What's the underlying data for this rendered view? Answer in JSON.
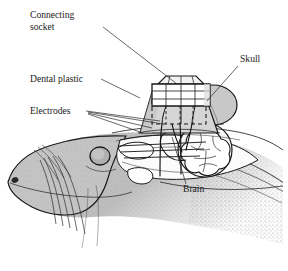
{
  "figure": {
    "background_color": "#ffffff",
    "ink_color": "#1a1a1a",
    "palette": {
      "skin_light": "#cfcfcf",
      "skin_mid": "#b4b4b4",
      "skin_dark": "#9a9a9a",
      "plastic_fill": "#d8d8d8",
      "socket_fill": "#ffffff",
      "skull_fill": "#c9c9c9",
      "brain_fill": "#ffffff",
      "cavity_fill": "#fdfdfd",
      "stipple": "#6f6f6f"
    }
  },
  "labels": [
    {
      "id": "connecting-socket",
      "lines": [
        "Connecting",
        "socket"
      ],
      "text_x": 30,
      "text_y": 18,
      "line_height": 11.5,
      "anchor": "start",
      "leader": "M 103 27 L 177 84"
    },
    {
      "id": "dental-plastic",
      "lines": [
        "Dental plastic"
      ],
      "text_x": 30,
      "text_y": 82,
      "line_height": 11.5,
      "anchor": "start",
      "leader": "M 101 79 L 140 98"
    },
    {
      "id": "electrodes",
      "lines": [
        "Electrodes"
      ],
      "text_x": 30,
      "text_y": 114,
      "line_height": 11.5,
      "anchor": "start",
      "leader": "M 86 111 L 160 121"
    },
    {
      "id": "skull",
      "lines": [
        "Skull"
      ],
      "text_x": 240,
      "text_y": 62,
      "line_height": 11.5,
      "anchor": "start",
      "leader": "M 238 66 L 207 101"
    },
    {
      "id": "brain",
      "lines": [
        "Brain"
      ],
      "text_x": 183,
      "text_y": 192,
      "line_height": 11.5,
      "anchor": "start",
      "leader": "M 186 184 L 172 137"
    }
  ],
  "electrode_leaders": [
    "M 88 112 L 163 124",
    "M 88 113 L 152 128",
    "M 88 114 L 143 133"
  ],
  "parts": {
    "connecting_socket": {
      "name": "connecting-socket",
      "description": "rectangular connector block with internal pin grid on top of the implant"
    },
    "dental_plastic": {
      "name": "dental-plastic",
      "description": "trapezoidal acrylic cap anchoring the socket to the skull, dashed hidden outline"
    },
    "electrodes": {
      "name": "electrodes",
      "description": "fine wires running from the socket through the skull into the brain"
    },
    "skull": {
      "name": "skull",
      "description": "cut bone shown as a rounded shaded mass behind the implant"
    },
    "brain": {
      "name": "brain",
      "description": "lobed cerebral mass inside the cranial cavity"
    },
    "head": {
      "name": "seal-head",
      "description": "seal head in profile facing left with whiskers, eye and nostril"
    }
  }
}
